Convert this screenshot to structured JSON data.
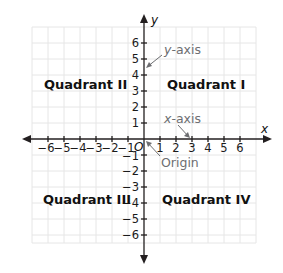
{
  "diagram": {
    "axes": {
      "x_label": "x",
      "y_label": "y",
      "origin_label": "O",
      "x_ticks": [
        "−6",
        "−5",
        "−4",
        "−3",
        "−2",
        "−1",
        "1",
        "2",
        "3",
        "4",
        "5",
        "6"
      ],
      "y_ticks_positive": [
        "1",
        "2",
        "3",
        "4",
        "5",
        "6"
      ],
      "y_ticks_negative": [
        "−1",
        "−2",
        "−3",
        "−4",
        "−5",
        "−6"
      ]
    },
    "quadrants": {
      "q1": "Quadrant I",
      "q2": "Quadrant II",
      "q3": "Quadrant III",
      "q4": "Quadrant IV"
    },
    "annotations": {
      "y_axis": "y-axis",
      "y_axis_italic_part": "y",
      "y_axis_rest": "-axis",
      "x_axis": "x-axis",
      "x_axis_italic_part": "x",
      "x_axis_rest": "-axis",
      "origin": "Origin"
    },
    "colors": {
      "grid": "#e6e6e6",
      "axis": "#231f20",
      "annotation": "#6d6e71",
      "background": "#ffffff"
    }
  }
}
